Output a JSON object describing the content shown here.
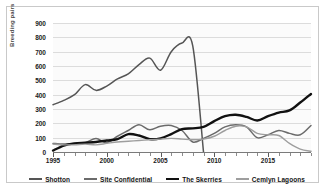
{
  "chart_data": {
    "type": "line",
    "title": "",
    "subtitle": "",
    "xlabel": "",
    "ylabel": "Breeding pairs",
    "xlim": [
      1995,
      2019
    ],
    "ylim": [
      0,
      900
    ],
    "ytick_labels": [
      "900",
      "800",
      "700",
      "600",
      "500",
      "400",
      "300",
      "200",
      "100",
      "0"
    ],
    "ytick_values": [
      900,
      800,
      700,
      600,
      500,
      400,
      300,
      200,
      100,
      0
    ],
    "xtick_labels": [
      "1995",
      "2000",
      "2005",
      "2010",
      "2015"
    ],
    "xtick_values": [
      1995,
      2000,
      2005,
      2010,
      2015
    ],
    "grid": "horizontal",
    "legend_position": "bottom",
    "x": [
      1995,
      1996,
      1997,
      1998,
      1999,
      2000,
      2001,
      2002,
      2003,
      2004,
      2005,
      2006,
      2007,
      2008,
      2009,
      2010,
      2011,
      2012,
      2013,
      2014,
      2015,
      2016,
      2017,
      2018,
      2019
    ],
    "series": [
      {
        "name": "Shotton",
        "color": "#555555",
        "width": 1.5,
        "values": [
          330,
          360,
          400,
          470,
          430,
          460,
          510,
          545,
          610,
          655,
          570,
          700,
          760,
          740,
          0,
          0,
          0,
          0,
          0,
          0,
          0,
          0,
          0,
          0,
          0
        ]
      },
      {
        "name": "Site Confidential",
        "color": "#6b6b6b",
        "width": 1.5,
        "values": [
          60,
          55,
          60,
          65,
          95,
          65,
          110,
          150,
          190,
          155,
          180,
          185,
          150,
          70,
          95,
          130,
          175,
          190,
          175,
          100,
          120,
          150,
          130,
          120,
          185
        ]
      },
      {
        "name": "The Skerries",
        "color": "#111111",
        "width": 2.4,
        "values": [
          10,
          45,
          60,
          65,
          70,
          80,
          90,
          125,
          115,
          90,
          95,
          125,
          160,
          165,
          175,
          215,
          250,
          260,
          245,
          220,
          250,
          275,
          290,
          345,
          405
        ]
      },
      {
        "name": "Cemlyn Lagoons",
        "color": "#9e9e9e",
        "width": 1.4,
        "values": [
          55,
          50,
          50,
          55,
          50,
          60,
          70,
          75,
          80,
          85,
          90,
          95,
          90,
          85,
          90,
          110,
          150,
          180,
          175,
          130,
          120,
          115,
          60,
          20,
          5
        ]
      }
    ]
  },
  "legend": {
    "items": [
      {
        "label": "Shotton",
        "color": "#555555",
        "width": 1.6
      },
      {
        "label": "Site Confidential",
        "color": "#6b6b6b",
        "width": 1.6
      },
      {
        "label": "The Skerries",
        "color": "#111111",
        "width": 2.6
      },
      {
        "label": "Cemlyn Lagoons",
        "color": "#9e9e9e",
        "width": 1.4
      }
    ]
  }
}
